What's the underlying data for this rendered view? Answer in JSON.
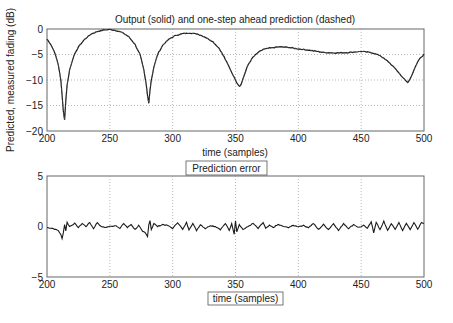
{
  "chart_data": [
    {
      "type": "line",
      "title": "Output (solid) and one-step ahead prediction (dashed)",
      "xlabel": "time (samples)",
      "ylabel": "Predicted, measured fading (dB)",
      "xlim": [
        200,
        500
      ],
      "ylim": [
        -20,
        0
      ],
      "xticks": [
        200,
        250,
        300,
        350,
        400,
        450,
        500
      ],
      "yticks": [
        0,
        -5,
        -10,
        -15,
        -20
      ],
      "grid": true,
      "series": [
        {
          "name": "Output (solid)",
          "x": [
            200,
            203,
            206,
            209,
            211,
            212,
            213,
            214,
            215,
            216,
            218,
            221,
            225,
            230,
            235,
            240,
            245,
            250,
            255,
            260,
            265,
            270,
            274,
            277,
            279,
            280,
            281,
            282,
            283,
            285,
            288,
            292,
            297,
            302,
            308,
            314,
            320,
            326,
            332,
            337,
            341,
            345,
            348,
            351,
            353,
            354,
            355,
            357,
            360,
            364,
            368,
            372,
            378,
            385,
            392,
            400,
            410,
            420,
            430,
            440,
            450,
            458,
            465,
            472,
            478,
            482,
            485,
            487,
            488,
            490,
            493,
            496,
            500
          ],
          "y": [
            -2,
            -3,
            -4.5,
            -7,
            -10,
            -13,
            -16,
            -17.8,
            -14,
            -11,
            -8,
            -5.5,
            -3.5,
            -2,
            -1,
            -0.5,
            -0.2,
            -0.1,
            -0.3,
            -0.7,
            -1.5,
            -3,
            -5,
            -8,
            -11,
            -13,
            -14.5,
            -12,
            -10,
            -7.5,
            -5,
            -3.2,
            -2,
            -1.3,
            -0.9,
            -0.8,
            -1,
            -1.6,
            -2.5,
            -3.8,
            -5.5,
            -7.5,
            -9,
            -10.5,
            -11.2,
            -11,
            -10.5,
            -9,
            -7,
            -5.5,
            -4.6,
            -4,
            -3.7,
            -3.5,
            -3.6,
            -3.9,
            -4.2,
            -4.6,
            -4.7,
            -4.6,
            -4.4,
            -4.6,
            -5.2,
            -6.5,
            -8,
            -9.2,
            -10,
            -10.5,
            -10.2,
            -9.2,
            -7.5,
            -6,
            -5
          ]
        },
        {
          "name": "One-step ahead prediction (dashed)",
          "note": "overlaps output curve"
        }
      ]
    },
    {
      "type": "line",
      "title": "Prediction error",
      "xlabel": "time (samples)",
      "ylabel": "",
      "xlim": [
        200,
        500
      ],
      "ylim": [
        -5,
        5
      ],
      "xticks": [
        200,
        250,
        300,
        350,
        400,
        450,
        500
      ],
      "yticks": [
        5,
        0,
        -5
      ],
      "grid": "vertical",
      "series": [
        {
          "name": "Prediction error",
          "x": [
            200,
            205,
            209,
            211,
            212,
            213,
            214,
            215,
            216,
            218,
            222,
            225,
            228,
            231,
            234,
            237,
            240,
            243,
            246,
            250,
            255,
            258,
            261,
            264,
            267,
            270,
            273,
            276,
            278,
            280,
            281,
            282,
            283,
            285,
            288,
            292,
            296,
            300,
            304,
            308,
            311,
            313,
            316,
            319,
            322,
            326,
            330,
            334,
            338,
            342,
            345,
            347,
            349,
            350,
            351,
            353,
            356,
            360,
            364,
            368,
            372,
            374,
            377,
            380,
            384,
            388,
            392,
            396,
            400,
            404,
            408,
            412,
            416,
            420,
            424,
            428,
            432,
            436,
            440,
            444,
            448,
            452,
            455,
            458,
            460,
            462,
            465,
            468,
            471,
            474,
            477,
            480,
            483,
            486,
            489,
            492,
            495,
            498,
            500
          ],
          "y": [
            -0.1,
            -0.2,
            -0.4,
            -0.8,
            -1.2,
            -0.6,
            0.2,
            -0.4,
            0.4,
            0,
            0.3,
            -0.1,
            0.3,
            0,
            0.4,
            -0.2,
            0.4,
            0,
            -0.1,
            0,
            0.1,
            -0.2,
            0.3,
            -0.1,
            0.2,
            -0.3,
            0.1,
            -0.5,
            -0.6,
            -1,
            0.2,
            0.6,
            -0.3,
            0.3,
            0,
            0.2,
            0.1,
            -0.2,
            0.4,
            -0.3,
            0.4,
            -0.3,
            0.3,
            -0.4,
            0.2,
            -0.2,
            0.1,
            0,
            -0.3,
            0.3,
            -0.4,
            0.3,
            -0.8,
            0.6,
            -0.5,
            0.2,
            -0.3,
            0,
            0.3,
            -0.2,
            0.4,
            -0.2,
            0.1,
            -0.1,
            0.2,
            0,
            -0.1,
            0.1,
            0,
            0.1,
            -0.1,
            0.3,
            -0.3,
            0.2,
            -0.3,
            0.3,
            -0.4,
            0.3,
            -0.2,
            0.2,
            -0.1,
            0.1,
            -0.2,
            0.5,
            -0.6,
            0.4,
            -0.3,
            0.5,
            -0.4,
            0.3,
            -0.3,
            0.4,
            -0.4,
            0.3,
            -0.3,
            0.4,
            -0.3,
            0.4,
            0.3
          ]
        }
      ]
    }
  ],
  "colors": {
    "line": "#1a1a1a",
    "grid": "#9a9a9a",
    "axis": "#555555"
  }
}
